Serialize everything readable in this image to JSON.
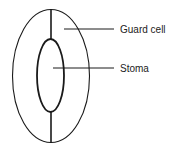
{
  "diagram": {
    "subject": "stoma",
    "labels": {
      "guard_cell": "Guard cell",
      "stoma": "Stoma"
    },
    "colors": {
      "stroke": "#1a1a1a",
      "text": "#222222",
      "background": "#ffffff"
    }
  }
}
